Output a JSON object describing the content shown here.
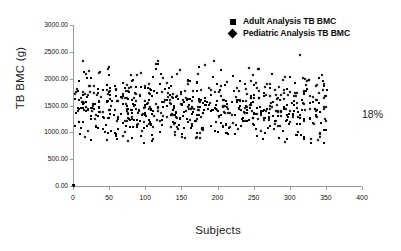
{
  "chart_data": {
    "type": "scatter",
    "title": "",
    "xlabel": "Subjects",
    "ylabel": "TB BMC (g)",
    "xlim": [
      0,
      400
    ],
    "ylim": [
      0,
      3000
    ],
    "xticks": [
      0,
      50,
      100,
      150,
      200,
      250,
      300,
      350,
      400
    ],
    "xtick_labels": [
      "0",
      "50",
      "100",
      "150",
      "200",
      "250",
      "300",
      "350",
      "400"
    ],
    "yticks": [
      0,
      500,
      1000,
      1500,
      2000,
      2500,
      3000
    ],
    "ytick_labels": [
      "0.00",
      "500.00",
      "1000.00",
      "1500.00",
      "2000.00",
      "2500.00",
      "3000.00"
    ],
    "grid": false,
    "legend_position": "top-right",
    "marker_color": "#000000",
    "series": [
      {
        "name": "Adult Analysis TB BMC",
        "marker": "square",
        "color": "#000000",
        "n_points": 350,
        "x_range": [
          1,
          350
        ],
        "y_mean": 1450,
        "y_range": [
          800,
          2300
        ]
      },
      {
        "name": "Pediatric Analysis TB BMC",
        "marker": "diamond",
        "color": "#000000",
        "n_points": 350,
        "x_range": [
          1,
          350
        ],
        "y_mean": 1520,
        "y_range": [
          820,
          2600
        ]
      }
    ],
    "annotations": [
      {
        "text": "18%",
        "x": 400,
        "y": 1350
      }
    ]
  },
  "legend": {
    "items": [
      {
        "label": "Adult Analysis TB BMC",
        "marker": "square"
      },
      {
        "label": "Pediatric Analysis TB BMC",
        "marker": "diamond"
      }
    ]
  },
  "annotation": {
    "text": "18%"
  },
  "axes": {
    "x_title": "Subjects",
    "y_title": "TB BMC (g)"
  }
}
